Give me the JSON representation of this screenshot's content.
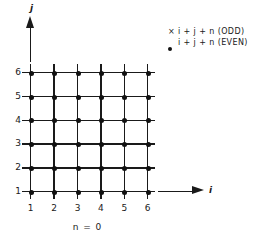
{
  "legend": {
    "rows": [
      {
        "marker": "cross-marker",
        "marker_glyph": "×",
        "label": "i + j + n (ODD)"
      },
      {
        "marker": "dot-marker",
        "marker_glyph": "",
        "label": "i + j + n (EVEN)"
      }
    ]
  },
  "axes": {
    "y_label": "j",
    "x_label": "i",
    "y_ticks": [
      "6",
      "5",
      "4",
      "3",
      "2",
      "1"
    ],
    "x_ticks": [
      "1",
      "2",
      "3",
      "4",
      "5",
      "6"
    ]
  },
  "caption": "n = 0",
  "colors": {
    "ink": "#1a1a1a",
    "marker": "#111111",
    "background": "#ffffff"
  },
  "chart_data": {
    "type": "scatter",
    "title": "n = 0",
    "xlabel": "i",
    "ylabel": "j",
    "xlim": [
      1,
      6
    ],
    "ylim": [
      1,
      6
    ],
    "grid": true,
    "legend_position": "top-right",
    "categories": [
      "1",
      "2",
      "3",
      "4",
      "5",
      "6"
    ],
    "series": [
      {
        "name": "i + j + n (EVEN)",
        "marker": "dot",
        "points": [
          [
            1,
            1
          ],
          [
            2,
            1
          ],
          [
            3,
            1
          ],
          [
            4,
            1
          ],
          [
            5,
            1
          ],
          [
            6,
            1
          ],
          [
            1,
            2
          ],
          [
            2,
            2
          ],
          [
            3,
            2
          ],
          [
            4,
            2
          ],
          [
            5,
            2
          ],
          [
            6,
            2
          ],
          [
            1,
            3
          ],
          [
            2,
            3
          ],
          [
            3,
            3
          ],
          [
            4,
            3
          ],
          [
            5,
            3
          ],
          [
            6,
            3
          ],
          [
            1,
            4
          ],
          [
            2,
            4
          ],
          [
            3,
            4
          ],
          [
            4,
            4
          ],
          [
            5,
            4
          ],
          [
            6,
            4
          ],
          [
            1,
            5
          ],
          [
            2,
            5
          ],
          [
            3,
            5
          ],
          [
            4,
            5
          ],
          [
            5,
            5
          ],
          [
            6,
            5
          ],
          [
            1,
            6
          ],
          [
            2,
            6
          ],
          [
            3,
            6
          ],
          [
            4,
            6
          ],
          [
            5,
            6
          ],
          [
            6,
            6
          ]
        ]
      },
      {
        "name": "i + j + n (ODD)",
        "marker": "cross",
        "points": []
      }
    ],
    "geometry": {
      "x0": 30,
      "y0": 191,
      "dx": 23.4,
      "dy": 23.8,
      "overhang_top": 8,
      "overhang_bottom": 8,
      "overhang_left": 8,
      "overhang_right": 8
    }
  }
}
